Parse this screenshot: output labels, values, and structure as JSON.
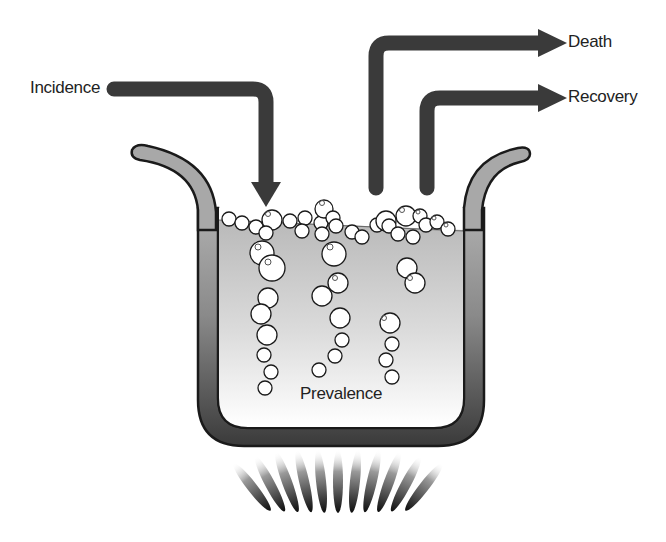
{
  "diagram": {
    "title": "",
    "labels": {
      "incidence": "Incidence",
      "death": "Death",
      "recovery": "Recovery",
      "prevalence": "Prevalence"
    },
    "arrows": [
      {
        "name": "incidence",
        "direction": "into pot"
      },
      {
        "name": "death",
        "direction": "out of pot"
      },
      {
        "name": "recovery",
        "direction": "out of pot"
      }
    ],
    "elements": {
      "pot": "cooking pot containing liquid with rising bubbles",
      "heat": "flame beneath pot"
    },
    "colors": {
      "arrow": "#3a3a3a",
      "pot_outline": "#1a1a1a",
      "pot_wall_dark": "#3c3c3c",
      "pot_rim": "#a8a8a8",
      "liquid_top": "#bdbdbd",
      "liquid_bottom": "#ffffff",
      "flame": "#111111",
      "text": "#222222"
    }
  }
}
